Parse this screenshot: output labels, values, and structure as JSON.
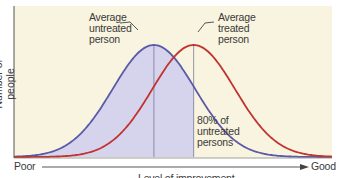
{
  "chart_data": {
    "type": "line",
    "title": "",
    "xlabel": "Level of improvement",
    "ylabel": "Number of people",
    "x_axis_ends": {
      "left": "Poor",
      "right": "Good"
    },
    "x": [
      0,
      10,
      20,
      30,
      40,
      50,
      60,
      70,
      80,
      90,
      100
    ],
    "series": [
      {
        "name": "Untreated",
        "color": "#5a5aa8",
        "mean": 44,
        "sd": 13,
        "filled_below_mean_of_treated": true,
        "fill": "#d6d3ec"
      },
      {
        "name": "Treated",
        "color": "#c0332f",
        "mean": 56.5,
        "sd": 13
      }
    ],
    "annotations": [
      {
        "text": "Average untreated person",
        "points_to": "peak of untreated curve"
      },
      {
        "text": "Average treated person",
        "points_to": "peak of treated curve"
      },
      {
        "text": "80% of untreated persons",
        "points_to": "shaded area under untreated curve left of treated mean"
      }
    ],
    "background": "#f8f4df",
    "grid": false,
    "legend": "none"
  },
  "labels": {
    "avg_untreated": [
      "Average",
      "untreated",
      "person"
    ],
    "avg_treated": [
      "Average",
      "treated",
      "person"
    ],
    "pct": [
      "80% of",
      "untreated",
      "persons"
    ],
    "poor": "Poor",
    "good": "Good",
    "xlabel": "Level of improvement",
    "ylabel": "Number of people"
  }
}
